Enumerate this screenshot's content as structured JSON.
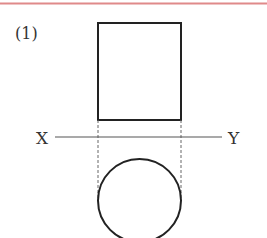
{
  "figure": {
    "label": "(1)",
    "axis_left_label": "X",
    "axis_right_label": "Y",
    "top_rule_color": "#e08a8a",
    "stroke_color": "#222222",
    "axis_color": "#555555"
  },
  "shapes": {
    "front_view": "rectangle",
    "top_view": "circle",
    "projection_lines": "dashed"
  }
}
